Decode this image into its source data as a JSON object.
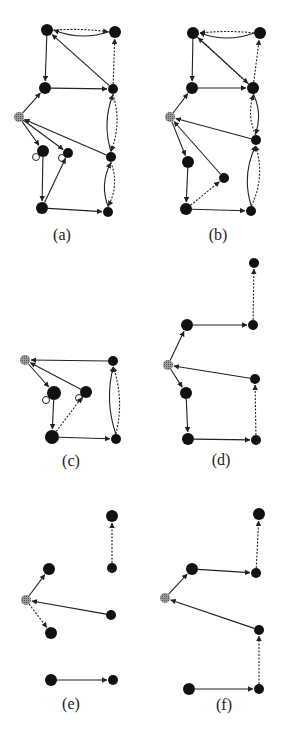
{
  "figure": {
    "colors": {
      "node": "#111111",
      "root_node": "#8a8a8a",
      "edge": "#222222",
      "background": "#ffffff"
    },
    "panels": [
      {
        "id": "a",
        "label": "(a)",
        "label_pos": [
          62,
          238
        ],
        "nodes": [
          {
            "id": "a1",
            "x": 47,
            "y": 30,
            "r": 6
          },
          {
            "id": "a2",
            "x": 115,
            "y": 32,
            "r": 6
          },
          {
            "id": "a3",
            "x": 45,
            "y": 88,
            "r": 6
          },
          {
            "id": "a4",
            "x": 113,
            "y": 89,
            "r": 5
          },
          {
            "id": "a0",
            "x": 19,
            "y": 117,
            "r": 5,
            "root": true
          },
          {
            "id": "a5",
            "x": 43,
            "y": 151,
            "r": 6,
            "self_loop": true
          },
          {
            "id": "a6",
            "x": 68,
            "y": 153,
            "r": 5,
            "self_loop": true
          },
          {
            "id": "a7",
            "x": 111,
            "y": 157,
            "r": 5
          },
          {
            "id": "a8",
            "x": 42,
            "y": 208,
            "r": 6
          },
          {
            "id": "a9",
            "x": 108,
            "y": 212,
            "r": 5
          }
        ],
        "edges": [
          {
            "from": "a2",
            "to": "a1",
            "style": "solid",
            "curve": -10
          },
          {
            "from": "a1",
            "to": "a2",
            "style": "dashed",
            "curve": -3
          },
          {
            "from": "a4",
            "to": "a1",
            "style": "solid",
            "curve": 0
          },
          {
            "from": "a4",
            "to": "a2",
            "style": "dashed",
            "curve": 0
          },
          {
            "from": "a1",
            "to": "a3",
            "style": "solid",
            "curve": 0
          },
          {
            "from": "a3",
            "to": "a4",
            "style": "solid",
            "curve": 0
          },
          {
            "from": "a0",
            "to": "a3",
            "style": "solid",
            "curve": 0
          },
          {
            "from": "a7",
            "to": "a4",
            "style": "solid",
            "curve": -10
          },
          {
            "from": "a4",
            "to": "a7",
            "style": "dashed",
            "curve": -10
          },
          {
            "from": "a7",
            "to": "a0",
            "style": "solid",
            "curve": 0
          },
          {
            "from": "a0",
            "to": "a5",
            "style": "solid",
            "curve": 0
          },
          {
            "from": "a0",
            "to": "a6",
            "style": "solid",
            "curve": 0
          },
          {
            "from": "a5",
            "to": "a8",
            "style": "solid",
            "curve": 0
          },
          {
            "from": "a8",
            "to": "a6",
            "style": "solid",
            "curve": 0
          },
          {
            "from": "a8",
            "to": "a9",
            "style": "solid",
            "curve": 0
          },
          {
            "from": "a9",
            "to": "a7",
            "style": "solid",
            "curve": -10
          },
          {
            "from": "a7",
            "to": "a9",
            "style": "dashed",
            "curve": -10
          }
        ]
      },
      {
        "id": "b",
        "label": "(b)",
        "label_pos": [
          218,
          238
        ],
        "nodes": [
          {
            "id": "b1",
            "x": 193,
            "y": 33,
            "r": 6
          },
          {
            "id": "b2",
            "x": 260,
            "y": 33,
            "r": 6
          },
          {
            "id": "b3",
            "x": 192,
            "y": 88,
            "r": 6
          },
          {
            "id": "b4",
            "x": 253,
            "y": 88,
            "r": 6
          },
          {
            "id": "b0",
            "x": 170,
            "y": 117,
            "r": 5,
            "root": true
          },
          {
            "id": "b5",
            "x": 256,
            "y": 140,
            "r": 5
          },
          {
            "id": "b6",
            "x": 188,
            "y": 162,
            "r": 6
          },
          {
            "id": "b7",
            "x": 224,
            "y": 178,
            "r": 5
          },
          {
            "id": "b8",
            "x": 186,
            "y": 209,
            "r": 6
          },
          {
            "id": "b9",
            "x": 251,
            "y": 211,
            "r": 5
          }
        ],
        "edges": [
          {
            "from": "b2",
            "to": "b1",
            "style": "solid",
            "curve": -10
          },
          {
            "from": "b2",
            "to": "b1",
            "style": "dashed",
            "curve": 3
          },
          {
            "from": "b4",
            "to": "b1",
            "style": "solid",
            "curve": 0
          },
          {
            "from": "b1",
            "to": "b4",
            "style": "dashed",
            "curve": 0
          },
          {
            "from": "b4",
            "to": "b2",
            "style": "dashed",
            "curve": 0
          },
          {
            "from": "b1",
            "to": "b3",
            "style": "solid",
            "curve": 0
          },
          {
            "from": "b3",
            "to": "b4",
            "style": "solid",
            "curve": 0
          },
          {
            "from": "b0",
            "to": "b3",
            "style": "solid",
            "curve": 0
          },
          {
            "from": "b5",
            "to": "b4",
            "style": "dashed",
            "curve": -8
          },
          {
            "from": "b4",
            "to": "b5",
            "style": "solid",
            "curve": -8
          },
          {
            "from": "b5",
            "to": "b0",
            "style": "solid",
            "curve": 0
          },
          {
            "from": "b0",
            "to": "b6",
            "style": "solid",
            "curve": 0
          },
          {
            "from": "b7",
            "to": "b0",
            "style": "solid",
            "curve": 0
          },
          {
            "from": "b6",
            "to": "b8",
            "style": "solid",
            "curve": 0
          },
          {
            "from": "b8",
            "to": "b7",
            "style": "dashed",
            "curve": 0
          },
          {
            "from": "b8",
            "to": "b9",
            "style": "solid",
            "curve": 0
          },
          {
            "from": "b9",
            "to": "b5",
            "style": "solid",
            "curve": -12
          },
          {
            "from": "b9",
            "to": "b5",
            "style": "dashed",
            "curve": 12
          }
        ]
      },
      {
        "id": "c",
        "label": "(c)",
        "label_pos": [
          71,
          464
        ],
        "nodes": [
          {
            "id": "c0",
            "x": 25,
            "y": 360,
            "r": 5,
            "root": true
          },
          {
            "id": "c1",
            "x": 113,
            "y": 361,
            "r": 5
          },
          {
            "id": "c2",
            "x": 54,
            "y": 393,
            "r": 7,
            "self_loop": true
          },
          {
            "id": "c3",
            "x": 86,
            "y": 392,
            "r": 6,
            "self_loop": true
          },
          {
            "id": "c4",
            "x": 52,
            "y": 437,
            "r": 7
          },
          {
            "id": "c5",
            "x": 116,
            "y": 439,
            "r": 5
          }
        ],
        "edges": [
          {
            "from": "c1",
            "to": "c0",
            "style": "solid",
            "curve": 0
          },
          {
            "from": "c0",
            "to": "c2",
            "style": "solid",
            "curve": 0
          },
          {
            "from": "c3",
            "to": "c0",
            "style": "solid",
            "curve": 0
          },
          {
            "from": "c2",
            "to": "c4",
            "style": "solid",
            "curve": 0
          },
          {
            "from": "c4",
            "to": "c3",
            "style": "dashed",
            "curve": 0
          },
          {
            "from": "c4",
            "to": "c5",
            "style": "solid",
            "curve": 0
          },
          {
            "from": "c5",
            "to": "c1",
            "style": "solid",
            "curve": -10
          },
          {
            "from": "c5",
            "to": "c1",
            "style": "dashed",
            "curve": 10
          }
        ]
      },
      {
        "id": "d",
        "label": "(d)",
        "label_pos": [
          221,
          463
        ],
        "nodes": [
          {
            "id": "d1",
            "x": 254,
            "y": 263,
            "r": 5
          },
          {
            "id": "d2",
            "x": 187,
            "y": 325,
            "r": 6
          },
          {
            "id": "d3",
            "x": 253,
            "y": 325,
            "r": 5
          },
          {
            "id": "d0",
            "x": 168,
            "y": 365,
            "r": 5,
            "root": true
          },
          {
            "id": "d4",
            "x": 255,
            "y": 379,
            "r": 5
          },
          {
            "id": "d5",
            "x": 186,
            "y": 393,
            "r": 6
          },
          {
            "id": "d6",
            "x": 188,
            "y": 439,
            "r": 6
          },
          {
            "id": "d7",
            "x": 256,
            "y": 440,
            "r": 5
          }
        ],
        "edges": [
          {
            "from": "d3",
            "to": "d1",
            "style": "dashed",
            "curve": 0
          },
          {
            "from": "d0",
            "to": "d2",
            "style": "solid",
            "curve": 0
          },
          {
            "from": "d2",
            "to": "d3",
            "style": "solid",
            "curve": 0
          },
          {
            "from": "d4",
            "to": "d0",
            "style": "solid",
            "curve": 0
          },
          {
            "from": "d0",
            "to": "d5",
            "style": "solid",
            "curve": 0
          },
          {
            "from": "d5",
            "to": "d6",
            "style": "solid",
            "curve": 0
          },
          {
            "from": "d6",
            "to": "d7",
            "style": "solid",
            "curve": 0
          },
          {
            "from": "d7",
            "to": "d4",
            "style": "dashed",
            "curve": 0
          }
        ]
      },
      {
        "id": "e",
        "label": "(e)",
        "label_pos": [
          71,
          707
        ],
        "nodes": [
          {
            "id": "e1",
            "x": 112,
            "y": 516,
            "r": 6
          },
          {
            "id": "e2",
            "x": 112,
            "y": 568,
            "r": 5
          },
          {
            "id": "e3",
            "x": 49,
            "y": 569,
            "r": 6
          },
          {
            "id": "e0",
            "x": 26,
            "y": 600,
            "r": 5,
            "root": true
          },
          {
            "id": "e4",
            "x": 111,
            "y": 615,
            "r": 5
          },
          {
            "id": "e5",
            "x": 51,
            "y": 633,
            "r": 6
          },
          {
            "id": "e6",
            "x": 51,
            "y": 680,
            "r": 6
          },
          {
            "id": "e7",
            "x": 113,
            "y": 680,
            "r": 5
          }
        ],
        "edges": [
          {
            "from": "e2",
            "to": "e1",
            "style": "dashed",
            "curve": 0
          },
          {
            "from": "e0",
            "to": "e3",
            "style": "solid",
            "curve": 0
          },
          {
            "from": "e4",
            "to": "e0",
            "style": "solid",
            "curve": 0
          },
          {
            "from": "e0",
            "to": "e5",
            "style": "dashed",
            "curve": 0
          },
          {
            "from": "e6",
            "to": "e7",
            "style": "solid",
            "curve": 0
          }
        ]
      },
      {
        "id": "f",
        "label": "(f)",
        "label_pos": [
          224,
          708
        ],
        "nodes": [
          {
            "id": "f1",
            "x": 259,
            "y": 514,
            "r": 6
          },
          {
            "id": "f2",
            "x": 192,
            "y": 569,
            "r": 6
          },
          {
            "id": "f3",
            "x": 256,
            "y": 573,
            "r": 5
          },
          {
            "id": "f0",
            "x": 165,
            "y": 598,
            "r": 5,
            "root": true
          },
          {
            "id": "f4",
            "x": 259,
            "y": 630,
            "r": 5
          },
          {
            "id": "f5",
            "x": 189,
            "y": 689,
            "r": 6
          },
          {
            "id": "f6",
            "x": 259,
            "y": 689,
            "r": 5
          }
        ],
        "edges": [
          {
            "from": "f3",
            "to": "f1",
            "style": "dashed",
            "curve": 0
          },
          {
            "from": "f0",
            "to": "f2",
            "style": "solid",
            "curve": 0
          },
          {
            "from": "f2",
            "to": "f3",
            "style": "solid",
            "curve": 0
          },
          {
            "from": "f4",
            "to": "f0",
            "style": "solid",
            "curve": 0
          },
          {
            "from": "f5",
            "to": "f6",
            "style": "solid",
            "curve": 0
          },
          {
            "from": "f6",
            "to": "f4",
            "style": "dashed",
            "curve": 0
          }
        ]
      }
    ]
  }
}
